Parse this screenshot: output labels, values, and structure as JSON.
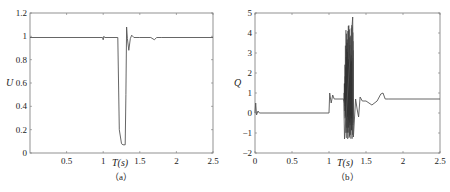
{
  "chart_data": [
    {
      "type": "line",
      "panel": "(a)",
      "title": "",
      "xlabel": "T(s)",
      "ylabel": "U",
      "xlim": [
        0,
        2.5
      ],
      "ylim": [
        0,
        1.2
      ],
      "xticks": [
        "0.5",
        "1",
        "1.5",
        "2",
        "2.5"
      ],
      "yticks": [
        "0",
        "0.2",
        "0.4",
        "0.6",
        "0.8",
        "1",
        "1.2"
      ],
      "grid": false,
      "series": [
        {
          "name": "U",
          "x": [
            0,
            0.99,
            1.0,
            1.01,
            1.02,
            1.2,
            1.22,
            1.25,
            1.27,
            1.3,
            1.31,
            1.32,
            1.33,
            1.35,
            1.37,
            1.39,
            1.42,
            1.5,
            1.65,
            1.7,
            1.73,
            1.8,
            2.5
          ],
          "y": [
            0.99,
            0.99,
            0.97,
            1.0,
            0.99,
            0.99,
            0.2,
            0.08,
            0.07,
            0.07,
            0.5,
            1.08,
            0.98,
            0.88,
            0.98,
            1.01,
            0.99,
            0.99,
            0.99,
            0.97,
            0.99,
            0.99,
            0.99
          ]
        }
      ]
    },
    {
      "type": "line",
      "panel": "(b)",
      "title": "",
      "xlabel": "T(s)",
      "ylabel": "Q",
      "xlim": [
        0,
        2.5
      ],
      "ylim": [
        -2,
        5
      ],
      "xticks": [
        "0",
        "0.5",
        "1",
        "1.5",
        "2",
        "2.5"
      ],
      "yticks": [
        "-2",
        "-1",
        "0",
        "1",
        "2",
        "3",
        "4",
        "5"
      ],
      "grid": false,
      "series": [
        {
          "name": "Q",
          "x": [
            0,
            0.01,
            0.02,
            0.04,
            0.06,
            1.0,
            1.01,
            1.03,
            1.05,
            1.07,
            1.2,
            1.21,
            1.32,
            1.33,
            1.36,
            1.38,
            1.4,
            1.42,
            1.45,
            1.5,
            1.58,
            1.65,
            1.7,
            1.73,
            1.76,
            1.8,
            2.5
          ],
          "y": [
            0,
            0.5,
            -0.1,
            0.1,
            0,
            0,
            1.0,
            0.5,
            0.9,
            0.7,
            0.7,
            -1.3,
            4.8,
            -1.2,
            0.7,
            0.2,
            -0.2,
            0.8,
            0.6,
            0.6,
            0.4,
            0.6,
            0.95,
            1.0,
            0.7,
            0.7,
            0.7
          ]
        }
      ],
      "annotations": [
        "dense oscillation between T=1.2s and T=1.33s spanning approx -1.3 to 4.8"
      ]
    }
  ],
  "captions": {
    "a": "（a）",
    "b": "（b）"
  },
  "colors": {
    "line": "#555555",
    "axis": "#666666",
    "burst": "#333333"
  }
}
